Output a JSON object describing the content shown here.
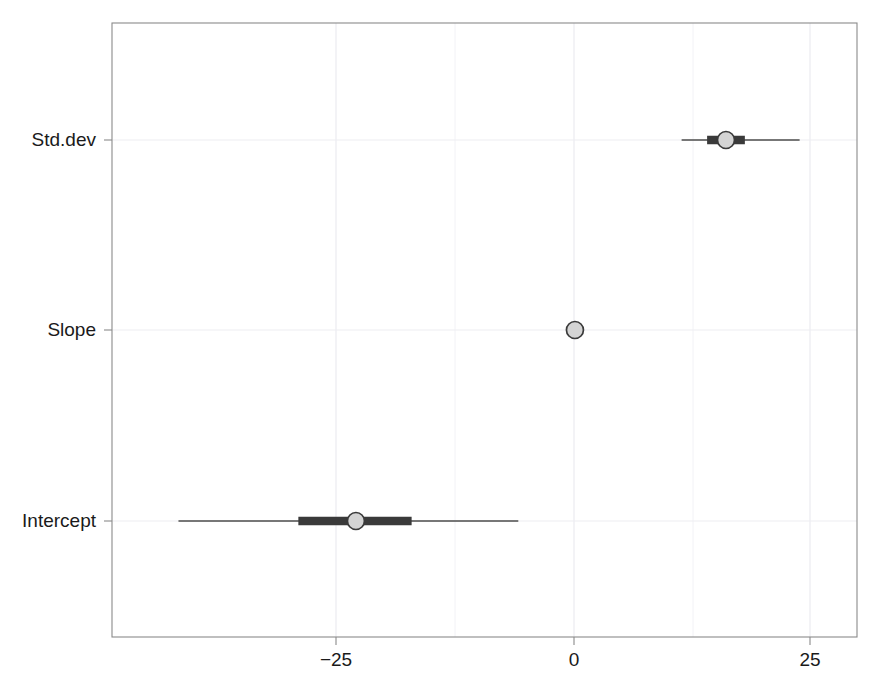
{
  "chart_data": {
    "type": "interval",
    "title": "",
    "subtitle": "",
    "xlabel": "",
    "ylabel": "",
    "categories": [
      "Intercept",
      "Slope",
      "Std.dev"
    ],
    "x_ticks": [
      -25,
      0,
      25
    ],
    "x_tick_labels": [
      "−25",
      "0",
      "25"
    ],
    "xlim": [
      -44.5,
      30.0
    ],
    "grid": true,
    "grid_minor_ticks": [
      -12.5,
      12.5
    ],
    "legend": "none",
    "point_color": "#d4d4d4",
    "point_edge_color": "#3a3a3a",
    "interval_color": "#3a3a3a",
    "outer_interval_color": "#4c4c4c",
    "panel_border_color": "#8a8a8a",
    "grid_color": "#ededf2",
    "background_color": "#ffffff",
    "series": [
      {
        "name": "Std.dev",
        "estimate": 16.1,
        "inner_low": 14.1,
        "inner_high": 18.1,
        "outer_low": 11.4,
        "outer_high": 23.9
      },
      {
        "name": "Slope",
        "estimate": 0.1,
        "inner_low": 0.0,
        "inner_high": 0.2,
        "outer_low": -0.3,
        "outer_high": 0.5
      },
      {
        "name": "Intercept",
        "estimate": -23.1,
        "inner_low": -29.2,
        "inner_high": -17.2,
        "outer_low": -41.9,
        "outer_high": -5.9
      }
    ]
  },
  "labels": {
    "cat_std_dev": "Std.dev",
    "cat_slope": "Slope",
    "cat_intercept": "Intercept",
    "tick_neg25": "−25",
    "tick_0": "0",
    "tick_25": "25"
  }
}
